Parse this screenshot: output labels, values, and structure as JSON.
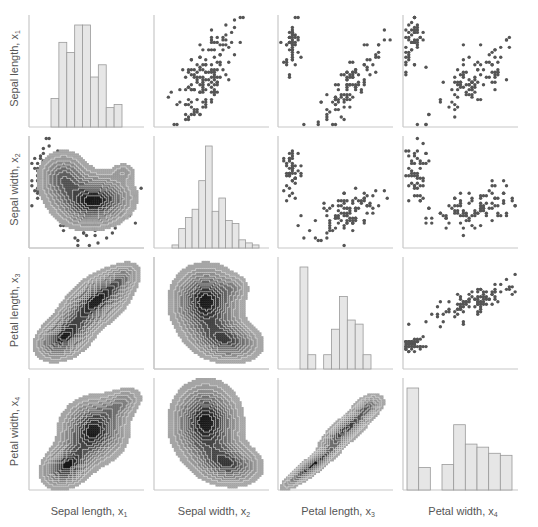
{
  "chart_data": {
    "type": "pairplot",
    "title": "",
    "variables": [
      {
        "name": "Sepal length",
        "symbol": "x",
        "index": "1"
      },
      {
        "name": "Sepal width",
        "symbol": "x",
        "index": "2"
      },
      {
        "name": "Petal length",
        "symbol": "x",
        "index": "3"
      },
      {
        "name": "Petal width",
        "symbol": "x",
        "index": "4"
      }
    ],
    "layout": {
      "upper": "scatter",
      "diagonal": "histogram",
      "lower": "kde_contour",
      "grid": false,
      "ticks": false
    },
    "colors": {
      "bar_fill": "#e6e6e6",
      "bar_edge": "#9a9a9a",
      "point": "#555555",
      "axis": "#c8c8c8",
      "kde_dark": "#1e1e1e",
      "kde_light": "#9a9a9a"
    },
    "histograms": [
      {
        "variable": "Sepal length",
        "bins": 9,
        "relative_heights": [
          0.28,
          0.83,
          0.73,
          1.0,
          1.0,
          0.49,
          0.61,
          0.19,
          0.22
        ]
      },
      {
        "variable": "Sepal width",
        "bins": 13,
        "relative_heights": [
          0.03,
          0.19,
          0.3,
          0.38,
          0.66,
          1.0,
          0.36,
          0.49,
          0.27,
          0.24,
          0.08,
          0.05,
          0.03
        ]
      },
      {
        "variable": "Petal length",
        "bins": 9,
        "relative_heights": [
          1.0,
          0.14,
          0.0,
          0.14,
          0.39,
          0.71,
          0.48,
          0.44,
          0.14
        ]
      },
      {
        "variable": "Petal width",
        "bins": 9,
        "relative_heights": [
          1.0,
          0.22,
          0.0,
          0.25,
          0.64,
          0.45,
          0.42,
          0.36,
          0.34
        ]
      }
    ],
    "scatter_pairs": [
      {
        "x": "Sepal width",
        "y": "Sepal length",
        "clusters": [
          {
            "cx": 0.55,
            "cy": 0.3,
            "sx": 0.13,
            "sy": 0.14,
            "n": 50,
            "r": 0.7
          },
          {
            "cx": 0.4,
            "cy": 0.68,
            "sx": 0.12,
            "sy": 0.16,
            "n": 100,
            "r": 0.55
          }
        ]
      },
      {
        "x": "Petal length",
        "y": "Sepal length",
        "clusters": [
          {
            "cx": 0.12,
            "cy": 0.25,
            "sx": 0.03,
            "sy": 0.12,
            "n": 50,
            "r": 0.3
          },
          {
            "cx": 0.63,
            "cy": 0.62,
            "sx": 0.14,
            "sy": 0.18,
            "n": 100,
            "r": 0.85
          }
        ]
      },
      {
        "x": "Petal width",
        "y": "Sepal length",
        "clusters": [
          {
            "cx": 0.08,
            "cy": 0.25,
            "sx": 0.05,
            "sy": 0.12,
            "n": 50,
            "r": 0.3
          },
          {
            "cx": 0.62,
            "cy": 0.6,
            "sx": 0.19,
            "sy": 0.18,
            "n": 100,
            "r": 0.75
          }
        ]
      },
      {
        "x": "Sepal length",
        "y": "Sepal width",
        "clusters": [
          {
            "cx": 0.12,
            "cy": 0.3,
            "sx": 0.05,
            "sy": 0.14,
            "n": 50,
            "r": 0.2
          },
          {
            "cx": 0.6,
            "cy": 0.7,
            "sx": 0.14,
            "sy": 0.12,
            "n": 100,
            "r": 0.4
          }
        ]
      },
      {
        "x": "Sepal width",
        "y": "Petal length",
        "clusters": []
      },
      {
        "x": "Petal length",
        "y": "Sepal width",
        "clusters": [
          {
            "cx": 0.12,
            "cy": 0.32,
            "sx": 0.04,
            "sy": 0.14,
            "n": 50,
            "r": 0.2
          },
          {
            "cx": 0.6,
            "cy": 0.68,
            "sx": 0.15,
            "sy": 0.11,
            "n": 100,
            "r": 0.45
          }
        ]
      },
      {
        "x": "Petal width",
        "y": "Sepal width",
        "clusters": [
          {
            "cx": 0.1,
            "cy": 0.35,
            "sx": 0.05,
            "sy": 0.14,
            "n": 50,
            "r": 0.2
          },
          {
            "cx": 0.62,
            "cy": 0.66,
            "sx": 0.19,
            "sy": 0.11,
            "n": 100,
            "r": 0.5
          }
        ]
      },
      {
        "x": "Petal width",
        "y": "Petal length",
        "clusters": [
          {
            "cx": 0.08,
            "cy": 0.78,
            "sx": 0.05,
            "sy": 0.03,
            "n": 50,
            "r": 0.2
          },
          {
            "cx": 0.62,
            "cy": 0.4,
            "sx": 0.19,
            "sy": 0.09,
            "n": 100,
            "r": 0.8
          }
        ]
      }
    ],
    "kde_pairs": [
      {
        "x": "Sepal length",
        "y": "Sepal width",
        "modes": [
          {
            "cx": 0.3,
            "cy": 0.38,
            "sx": 0.12,
            "sy": 0.13,
            "w": 0.55,
            "rot": 0
          },
          {
            "cx": 0.57,
            "cy": 0.58,
            "sx": 0.17,
            "sy": 0.12,
            "w": 1.0,
            "rot": -10
          },
          {
            "cx": 0.82,
            "cy": 0.32,
            "sx": 0.06,
            "sy": 0.05,
            "w": 0.2,
            "rot": 0
          }
        ]
      },
      {
        "x": "Sepal length",
        "y": "Petal length",
        "modes": [
          {
            "cx": 0.3,
            "cy": 0.72,
            "sx": 0.13,
            "sy": 0.09,
            "w": 0.9,
            "rot": -30
          },
          {
            "cx": 0.58,
            "cy": 0.4,
            "sx": 0.19,
            "sy": 0.1,
            "w": 1.0,
            "rot": -40
          },
          {
            "cx": 0.8,
            "cy": 0.2,
            "sx": 0.1,
            "sy": 0.06,
            "w": 0.3,
            "rot": -40
          }
        ]
      },
      {
        "x": "Sepal width",
        "y": "Petal length",
        "modes": [
          {
            "cx": 0.45,
            "cy": 0.4,
            "sx": 0.15,
            "sy": 0.16,
            "w": 1.0,
            "rot": 0
          },
          {
            "cx": 0.62,
            "cy": 0.74,
            "sx": 0.16,
            "sy": 0.1,
            "w": 0.75,
            "rot": 10
          },
          {
            "cx": 0.7,
            "cy": 0.27,
            "sx": 0.07,
            "sy": 0.06,
            "w": 0.2,
            "rot": 0
          }
        ]
      },
      {
        "x": "Sepal length",
        "y": "Petal width",
        "modes": [
          {
            "cx": 0.33,
            "cy": 0.78,
            "sx": 0.12,
            "sy": 0.09,
            "w": 0.95,
            "rot": -35
          },
          {
            "cx": 0.56,
            "cy": 0.47,
            "sx": 0.15,
            "sy": 0.14,
            "w": 1.0,
            "rot": -55
          },
          {
            "cx": 0.8,
            "cy": 0.23,
            "sx": 0.11,
            "sy": 0.07,
            "w": 0.35,
            "rot": -30
          }
        ]
      },
      {
        "x": "Sepal width",
        "y": "Petal width",
        "modes": [
          {
            "cx": 0.45,
            "cy": 0.4,
            "sx": 0.15,
            "sy": 0.18,
            "w": 1.0,
            "rot": 0
          },
          {
            "cx": 0.64,
            "cy": 0.76,
            "sx": 0.15,
            "sy": 0.1,
            "w": 0.75,
            "rot": 10
          }
        ]
      },
      {
        "x": "Petal length",
        "y": "Petal width",
        "modes": [
          {
            "cx": 0.3,
            "cy": 0.78,
            "sx": 0.16,
            "sy": 0.035,
            "w": 1.0,
            "rot": -38
          },
          {
            "cx": 0.6,
            "cy": 0.45,
            "sx": 0.15,
            "sy": 0.05,
            "w": 0.85,
            "rot": -40
          },
          {
            "cx": 0.78,
            "cy": 0.25,
            "sx": 0.08,
            "sy": 0.05,
            "w": 0.45,
            "rot": -30
          }
        ]
      }
    ]
  },
  "labels": {
    "rows": [
      {
        "text": "Sepal length, x",
        "sub": "1"
      },
      {
        "text": "Sepal width, x",
        "sub": "2"
      },
      {
        "text": "Petal length, x",
        "sub": "3"
      },
      {
        "text": "Petal width, x",
        "sub": "4"
      }
    ],
    "cols": [
      {
        "text": "Sepal length, x",
        "sub": "1"
      },
      {
        "text": "Sepal width, x",
        "sub": "2"
      },
      {
        "text": "Petal length, x",
        "sub": "3"
      },
      {
        "text": "Petal width, x",
        "sub": "4"
      }
    ]
  }
}
